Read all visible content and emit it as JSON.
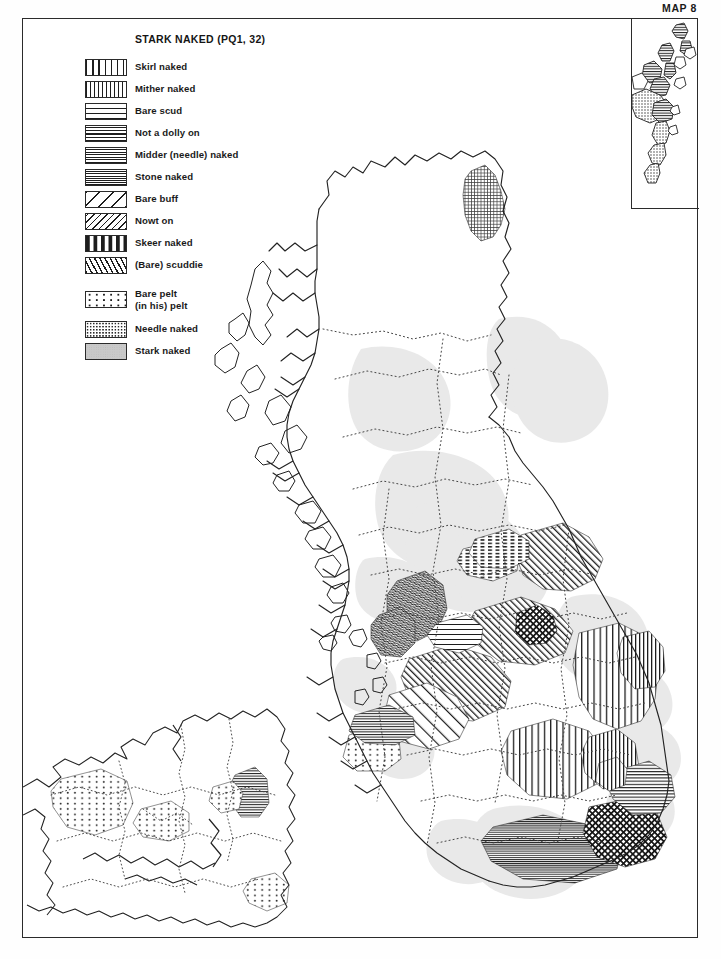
{
  "map_number": "MAP 8",
  "legend": {
    "title": "STARK NAKED (PQ1, 32)",
    "entries": [
      {
        "label": "Skirl naked",
        "pattern": "vertical-lines-wide",
        "swatch_class": "pat-vert-wide"
      },
      {
        "label": "Mither naked",
        "pattern": "vertical-lines-dense",
        "swatch_class": "pat-vert-dense"
      },
      {
        "label": "Bare scud",
        "pattern": "horizontal-lines-wide",
        "swatch_class": "pat-horiz-wide"
      },
      {
        "label": "Not a dolly on",
        "pattern": "horizontal-lines-medium",
        "swatch_class": "pat-horiz-med"
      },
      {
        "label": "Midder (needle) naked",
        "pattern": "horizontal-lines-close",
        "swatch_class": "pat-horiz-close"
      },
      {
        "label": "Stone naked",
        "pattern": "horizontal-lines-dense",
        "swatch_class": "pat-horiz-dense"
      },
      {
        "label": "Bare buff",
        "pattern": "diagonal-lines-sparse",
        "swatch_class": "pat-diag-sparse"
      },
      {
        "label": "Nowt on",
        "pattern": "diagonal-lines-dense",
        "swatch_class": "pat-diag-dense"
      },
      {
        "label": "Skeer naked",
        "pattern": "broken-dashes",
        "swatch_class": "pat-dash"
      },
      {
        "label": "(Bare) scuddie",
        "pattern": "squiggle-texture",
        "swatch_class": "pat-squiggle"
      }
    ],
    "entries_group2": [
      {
        "label": "Bare pelt\n(in his) pelt",
        "label_line1": "Bare pelt",
        "label_line2": "(in his) pelt",
        "pattern": "sparse-dots",
        "swatch_class": "pat-dots-sparse"
      },
      {
        "label": "Needle naked",
        "pattern": "medium-stipple",
        "swatch_class": "pat-stipple"
      },
      {
        "label": "Stark naked",
        "pattern": "light-gray-solid",
        "swatch_class": "pat-gray"
      }
    ]
  },
  "colors": {
    "ink": "#2b2b2b",
    "hatch": "#1d1d1d",
    "shade_gray": "#dcdcdc",
    "paper": "#ffffff"
  },
  "map": {
    "region_name": "Scotland and Northern Ireland",
    "shetland_inset_label": "",
    "border_style": "county boundaries shown as dotted lines"
  }
}
